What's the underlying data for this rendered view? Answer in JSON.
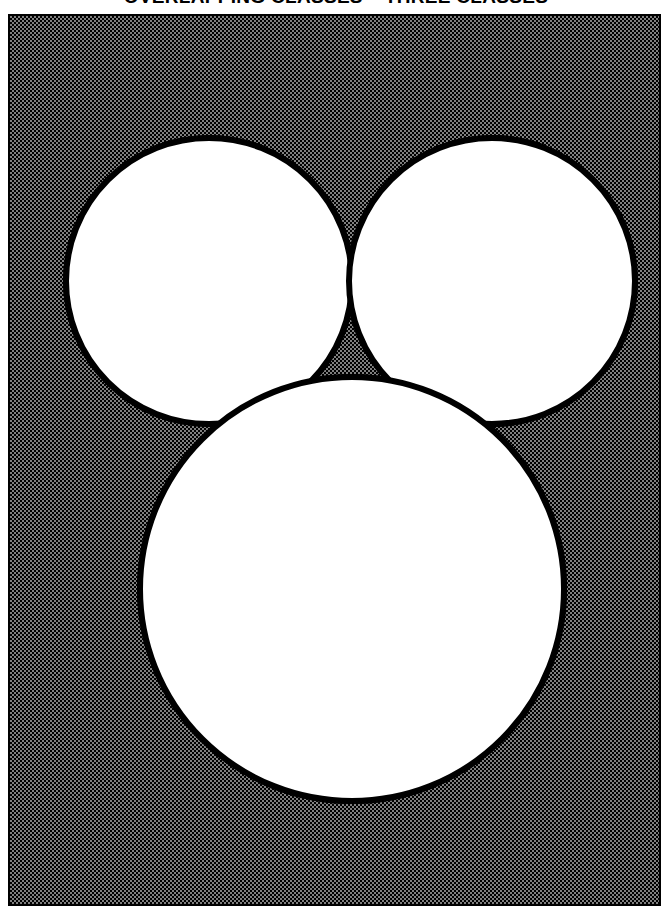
{
  "page": {
    "title": "OVERLAPPING CLASSES – THREE CLASSES",
    "background_color": "#ffffff",
    "frame_color": "#000000",
    "fill_color": "#808080"
  },
  "figure": {
    "caption": "OVERLAPPING CLASSES – THREE CLASSES",
    "frame": {
      "x": 8,
      "y": 14,
      "width": 653,
      "height": 892,
      "border_width": 2,
      "border_color": "#000000",
      "background_pattern": "50% checkerboard dither",
      "background_color": "#808080"
    },
    "diagram_type": "venn-three-set",
    "stroke_color": "#000000",
    "stroke_width": 6,
    "circle_fill": "#ffffff",
    "circles": [
      {
        "name": "upper-left-class",
        "cx": 199,
        "cy": 265,
        "r": 143
      },
      {
        "name": "upper-right-class",
        "cx": 482,
        "cy": 265,
        "r": 143
      },
      {
        "name": "lower-center-class",
        "cx": 342,
        "cy": 573,
        "r": 212
      }
    ],
    "regions": [
      "upper-left-only",
      "upper-right-only",
      "lower-center-only",
      "upper-left-and-upper-right",
      "upper-left-and-lower-center",
      "upper-right-and-lower-center",
      "all-three"
    ]
  }
}
